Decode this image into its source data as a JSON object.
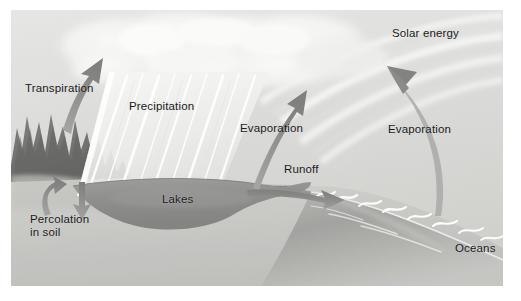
{
  "figure": {
    "type": "illustration-diagram",
    "canvas": {
      "width": 492,
      "height": 276,
      "offset_x": 11,
      "offset_y": 10,
      "background_color": "#d8d8d6",
      "page_background": "#ffffff"
    }
  },
  "labels": {
    "transpiration": "Transpiration",
    "precipitation": "Precipitation",
    "evaporation_lake": "Evaporation",
    "evaporation_ocean": "Evaporation",
    "solar_energy": "Solar energy",
    "runoff": "Runoff",
    "lakes": "Lakes",
    "percolation": "Percolation\nin soil",
    "oceans": "Oceans"
  },
  "colors": {
    "sky": "#dcdcda",
    "cloud": "#f4f4f2",
    "rain": "#efefed",
    "land": "#c9c9c6",
    "water_dark": "#8e8e8c",
    "water_mid": "#a6a6a3",
    "trees": "#6f6f6d",
    "arrow": "#8a8a88",
    "text": "#1a1a1a",
    "sun_ray": "#ededeb"
  },
  "elements": [
    {
      "name": "sun-rays",
      "description": "concentric arc bands from upper right"
    },
    {
      "name": "cloud-mass",
      "description": "fluffy cumulus cloud across top left and centre"
    },
    {
      "name": "rain-band",
      "description": "diagonal white streaks of falling precipitation"
    },
    {
      "name": "forest-trees",
      "description": "dark conifer silhouettes on left hillside"
    },
    {
      "name": "lake-basin",
      "description": "dark bowl-shaped lake in foreground"
    },
    {
      "name": "ocean-band",
      "description": "diagonal ocean with white wave crests on right"
    },
    {
      "name": "transpiration-arrow",
      "description": "arrow from forest up to cloud"
    },
    {
      "name": "percolation-arrows",
      "description": "curved up arrow and straight down arrow in soil"
    },
    {
      "name": "evaporation-arrow-lake",
      "description": "arrow rising from lake to cloud"
    },
    {
      "name": "evaporation-arrow-ocean",
      "description": "curved arrow rising from ocean to sun rays"
    },
    {
      "name": "runoff-arrow",
      "description": "arrow from lake outlet toward ocean"
    }
  ]
}
